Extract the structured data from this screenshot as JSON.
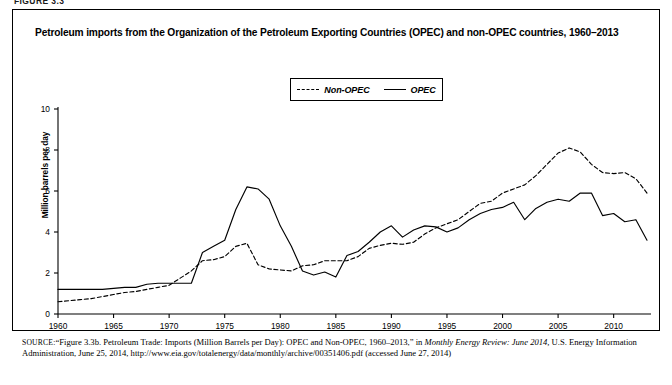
{
  "figure_number": "FIGURE 3.3",
  "figure": {
    "title": "Petroleum imports from the Organization of the Petroleum Exporting Countries (OPEC) and non-OPEC countries, 1960–2013"
  },
  "source": {
    "label": "SOURCE:",
    "text_part1": "“Figure 3.3b. Petroleum Trade: Imports (Million Barrels per Day): OPEC and Non-OPEC, 1960–2013,” in ",
    "italic1": "Monthly Energy Review: June 2014,",
    "text_part2": " U.S. Energy Information Administration, June 25, 2014, http://www.eia.gov/totalenergy/data/monthly/archive/00351406.pdf (accessed June 27, 2014)"
  },
  "legend": {
    "entries": [
      {
        "label": "Non-OPEC",
        "style": "dashed"
      },
      {
        "label": "OPEC",
        "style": "solid"
      }
    ]
  },
  "chart_data": {
    "type": "line",
    "title": "Petroleum imports from the Organization of the Petroleum Exporting Countries (OPEC) and non-OPEC countries, 1960–2013",
    "xlabel": "",
    "ylabel": "Million barrels per day",
    "xlim": [
      1960,
      2013
    ],
    "ylim": [
      0,
      10
    ],
    "yticks": [
      0,
      2,
      4,
      6,
      8,
      10
    ],
    "xticks": [
      1960,
      1965,
      1970,
      1975,
      1980,
      1985,
      1990,
      1995,
      2000,
      2005,
      2010
    ],
    "grid": false,
    "legend_position": "top-center",
    "x": [
      1960,
      1961,
      1962,
      1963,
      1964,
      1965,
      1966,
      1967,
      1968,
      1969,
      1970,
      1971,
      1972,
      1973,
      1974,
      1975,
      1976,
      1977,
      1978,
      1979,
      1980,
      1981,
      1982,
      1983,
      1984,
      1985,
      1986,
      1987,
      1988,
      1989,
      1990,
      1991,
      1992,
      1993,
      1994,
      1995,
      1996,
      1997,
      1998,
      1999,
      2000,
      2001,
      2002,
      2003,
      2004,
      2005,
      2006,
      2007,
      2008,
      2009,
      2010,
      2011,
      2012,
      2013
    ],
    "series": [
      {
        "name": "Non-OPEC",
        "style": "dashed",
        "values": [
          0.6,
          0.65,
          0.7,
          0.75,
          0.85,
          0.95,
          1.05,
          1.1,
          1.2,
          1.3,
          1.4,
          1.75,
          2.1,
          2.6,
          2.65,
          2.8,
          3.3,
          3.45,
          2.4,
          2.2,
          2.15,
          2.1,
          2.35,
          2.4,
          2.6,
          2.6,
          2.6,
          2.8,
          3.2,
          3.35,
          3.45,
          3.4,
          3.5,
          3.9,
          4.2,
          4.4,
          4.6,
          5.0,
          5.4,
          5.5,
          5.9,
          6.1,
          6.3,
          6.75,
          7.3,
          7.85,
          8.1,
          7.9,
          7.3,
          6.9,
          6.85,
          6.9,
          6.6,
          5.9
        ]
      },
      {
        "name": "OPEC",
        "style": "solid",
        "values": [
          1.2,
          1.2,
          1.2,
          1.2,
          1.2,
          1.25,
          1.3,
          1.3,
          1.45,
          1.5,
          1.5,
          1.5,
          1.5,
          3.0,
          3.3,
          3.6,
          5.1,
          6.2,
          6.1,
          5.6,
          4.3,
          3.3,
          2.1,
          1.9,
          2.05,
          1.8,
          2.85,
          3.05,
          3.5,
          4.0,
          4.3,
          3.75,
          4.1,
          4.3,
          4.25,
          4.0,
          4.2,
          4.6,
          4.9,
          5.1,
          5.2,
          5.45,
          4.6,
          5.15,
          5.45,
          5.6,
          5.5,
          5.9,
          5.9,
          4.8,
          4.9,
          4.5,
          4.6,
          3.6
        ]
      }
    ]
  }
}
